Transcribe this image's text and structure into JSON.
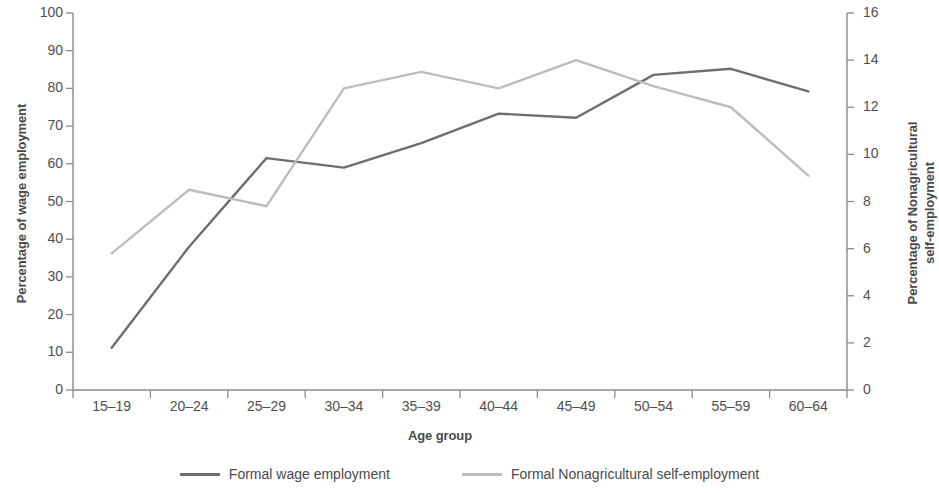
{
  "chart_data": {
    "type": "line",
    "title": "",
    "xlabel": "Age group",
    "categories": [
      "15–19",
      "20–24",
      "25–29",
      "30–34",
      "35–39",
      "40–44",
      "45–49",
      "50–54",
      "55–59",
      "60–64"
    ],
    "axes": {
      "left": {
        "label": "Percentage of wage employment",
        "ylim": [
          0,
          100
        ],
        "ticks": [
          0,
          10,
          20,
          30,
          40,
          50,
          60,
          70,
          80,
          90,
          100
        ]
      },
      "right": {
        "label_line1": "Percentage of Nonagricultural",
        "label_line2": "self-employment",
        "label": "Percentage of Nonagricultural self-employment",
        "ylim": [
          0,
          16
        ],
        "ticks": [
          0,
          2,
          4,
          6,
          8,
          10,
          12,
          14,
          16
        ]
      }
    },
    "grid": false,
    "legend_position": "bottom",
    "series": [
      {
        "name": "Formal wage employment",
        "axis": "left",
        "color": "#6e6e6e",
        "values": [
          11.2,
          38.0,
          61.5,
          59.0,
          65.5,
          73.3,
          72.2,
          83.6,
          85.2,
          79.2
        ]
      },
      {
        "name": "Formal Nonagricultural self-employment",
        "axis": "right",
        "color": "#bdbdbd",
        "values": [
          5.8,
          8.5,
          7.8,
          12.8,
          13.5,
          12.8,
          14.0,
          12.9,
          12.0,
          9.1
        ]
      }
    ]
  },
  "legend": {
    "items": [
      {
        "label": "Formal wage employment",
        "color": "#6e6e6e"
      },
      {
        "label": "Formal Nonagricultural self-employment",
        "color": "#bdbdbd"
      }
    ]
  }
}
